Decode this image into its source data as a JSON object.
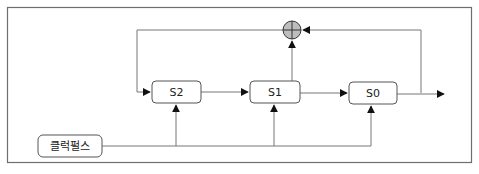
{
  "diagram": {
    "type": "lfsr-shift-register",
    "registers": [
      {
        "id": "S2",
        "label": "S2"
      },
      {
        "id": "S1",
        "label": "S1"
      },
      {
        "id": "S0",
        "label": "S0"
      }
    ],
    "clock": {
      "label": "클럭펄스"
    },
    "xor": {
      "symbol": "⊕",
      "inputs": [
        "S1-output",
        "S0-output"
      ],
      "output": "S2-input"
    },
    "colors": {
      "line": "#6e6e6e",
      "box_stroke": "#555555",
      "xor_fill": "#bdbdbd",
      "frame": "#6e6e6e",
      "background": "#ffffff"
    }
  }
}
